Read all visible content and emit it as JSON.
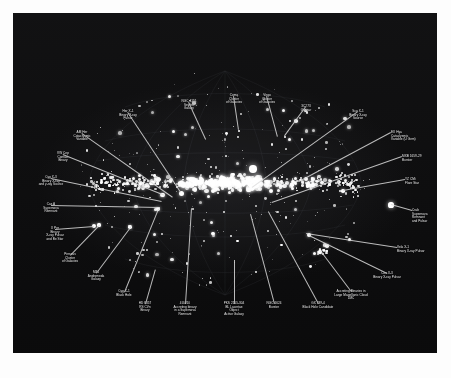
{
  "figure": {
    "type": "all-sky-map",
    "projection": "aitoff-galactic",
    "background_color": "#070707",
    "label_color": "#e9e9e9",
    "plate_bounds": {
      "x": 13,
      "y": 13,
      "width": 424,
      "height": 340
    }
  },
  "annotations": [
    {
      "id": "her-x-1",
      "text": "Her X-1\nBinary X-ray\nPulsar",
      "align": "center",
      "lx": 115,
      "ly": 97,
      "tx": 168,
      "ty": 179
    },
    {
      "id": "ngc-4151",
      "text": "NGC 4151\nSeyfert\nGalaxy",
      "align": "center",
      "lx": 176,
      "ly": 87,
      "tx": 193,
      "ty": 126
    },
    {
      "id": "coma-cluster",
      "text": "Coma\nCluster\nof Galaxies",
      "align": "center",
      "lx": 221,
      "ly": 81,
      "tx": 226,
      "ty": 117
    },
    {
      "id": "virgo-cluster",
      "text": "Virgo\nCluster\nof Galaxies",
      "align": "center",
      "lx": 254,
      "ly": 81,
      "tx": 265,
      "ty": 124
    },
    {
      "id": "3c273",
      "text": "3C273\nQuasar",
      "align": "center",
      "lx": 293,
      "ly": 92,
      "tx": 272,
      "ty": 123
    },
    {
      "id": "sco-x-1",
      "text": "Sco X-1\nBinary X-ray\nSource",
      "align": "center",
      "lx": 345,
      "ly": 97,
      "tx": 239,
      "ty": 175
    },
    {
      "id": "ex-hya",
      "text": "EX Hya\nCataclysmic\nVariable (U Gem)",
      "align": "left",
      "lx": 378,
      "ly": 118,
      "tx": 286,
      "ty": 169
    },
    {
      "id": "mxb-1659",
      "text": "MXB 1659-29\nBurster",
      "align": "left",
      "lx": 389,
      "ly": 142,
      "tx": 259,
      "ty": 190
    },
    {
      "id": "am-her",
      "text": "AM Her\nCataclysmic\nVariable",
      "align": "center",
      "lx": 69,
      "ly": 118,
      "tx": 160,
      "ty": 184
    },
    {
      "id": "vw-cep",
      "text": "VW Cep\nContact\nBinary",
      "align": "center",
      "lx": 50,
      "ly": 139,
      "tx": 152,
      "ty": 182
    },
    {
      "id": "cyg-x-3",
      "text": "Cyg X-3\nBinary X-ray\nand γ-ray Source",
      "align": "center",
      "lx": 38,
      "ly": 163,
      "tx": 149,
      "ty": 188
    },
    {
      "id": "yz-cmi",
      "text": "YZ CMi\nFlare Star",
      "align": "left",
      "lx": 392,
      "ly": 165,
      "tx": 330,
      "ty": 178
    },
    {
      "id": "cas-a",
      "text": "Cas A\nSupernova\nRemnant",
      "align": "center",
      "lx": 38,
      "ly": 190,
      "tx": 147,
      "ty": 194
    },
    {
      "id": "crab",
      "text": "Crab\nSupernova\nRemnant\nand Pulsar",
      "align": "left",
      "lx": 399,
      "ly": 196,
      "tx": 378,
      "ty": 192
    },
    {
      "id": "x-per",
      "text": "X Per\nBinary\nX-ray Pulsar\nand Be Star",
      "align": "center",
      "lx": 42,
      "ly": 214,
      "tx": 81,
      "ty": 213
    },
    {
      "id": "vela-x-1",
      "text": "Vela X-1\nBinary X-ray Pulsar",
      "align": "left",
      "lx": 384,
      "ly": 233,
      "tx": 293,
      "ty": 221
    },
    {
      "id": "perseus",
      "text": "Perseus\nCluster\nof Galaxies",
      "align": "center",
      "lx": 57,
      "ly": 240,
      "tx": 86,
      "ty": 212
    },
    {
      "id": "m31",
      "text": "M31\nAndromeda\nGalaxy",
      "align": "center",
      "lx": 83,
      "ly": 258,
      "tx": 118,
      "ty": 213
    },
    {
      "id": "cen-x-3",
      "text": "Cen X-3\nBinary X-ray Pulsar",
      "align": "center",
      "lx": 374,
      "ly": 259,
      "tx": 296,
      "ty": 223
    },
    {
      "id": "cyg-x-1",
      "text": "Cyg X-1\nBlack Hole",
      "align": "center",
      "lx": 111,
      "ly": 277,
      "tx": 145,
      "ty": 196
    },
    {
      "id": "lmc",
      "text": "Accreting Binaries in\nLarge Magellanic Cloud\nLMC",
      "align": "center",
      "lx": 338,
      "ly": 277,
      "tx": 307,
      "ty": 238
    },
    {
      "id": "hd-8357",
      "text": "HD 8357\nRS CVn\nBinary",
      "align": "center",
      "lx": 132,
      "ly": 289,
      "tx": 142,
      "ty": 256
    },
    {
      "id": "4u-1820",
      "text": "4U4/10\nAccreting binary\nin a Supernova\nRemnant",
      "align": "center",
      "lx": 172,
      "ly": 289,
      "tx": 178,
      "ty": 195
    },
    {
      "id": "pks-2155",
      "text": "PKS 2155-304\nBL Lacertae\nObject\nActive Galaxy",
      "align": "center",
      "lx": 221,
      "ly": 289,
      "tx": 221,
      "ty": 247
    },
    {
      "id": "ngc-6624",
      "text": "NGC 6624\nBurster",
      "align": "center",
      "lx": 261,
      "ly": 289,
      "tx": 237,
      "ty": 201
    },
    {
      "id": "gx-339-4",
      "text": "GX 339-4\nBlack Hole Candidate",
      "align": "center",
      "lx": 305,
      "ly": 289,
      "tx": 255,
      "ty": 199
    }
  ]
}
